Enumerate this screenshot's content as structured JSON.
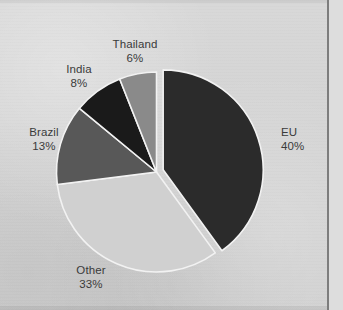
{
  "chart_data": {
    "type": "pie",
    "title": "",
    "subtitle": "",
    "xlabel": "",
    "ylabel": "",
    "legend_position": "none",
    "grid": false,
    "units": "percent",
    "total": 100,
    "start_angle_deg": 0,
    "direction": "clockwise",
    "categories": [
      "EU",
      "Other",
      "Brazil",
      "India",
      "Thailand"
    ],
    "values": [
      40,
      33,
      13,
      8,
      6
    ],
    "slices": [
      {
        "name": "EU",
        "value": 40,
        "value_label": "40%",
        "color": "#2b2b2b",
        "exploded": true,
        "label_position": "right"
      },
      {
        "name": "Other",
        "value": 33,
        "value_label": "33%",
        "color": "#d0d0d0",
        "exploded": false,
        "label_position": "bottom-left"
      },
      {
        "name": "Brazil",
        "value": 13,
        "value_label": "13%",
        "color": "#585858",
        "exploded": false,
        "label_position": "left"
      },
      {
        "name": "India",
        "value": 8,
        "value_label": "8%",
        "color": "#1a1a1a",
        "exploded": false,
        "label_position": "upper-left"
      },
      {
        "name": "Thailand",
        "value": 6,
        "value_label": "6%",
        "color": "#8a8a8a",
        "exploded": false,
        "label_position": "top"
      }
    ]
  },
  "style": {
    "background_color": "#d4d4d4",
    "slice_separator_color": "#f2f2f2",
    "label_text_color": "#3a3a3a",
    "page_edge_color": "#7d7d7d",
    "page_margin_color": "#dddddd"
  }
}
